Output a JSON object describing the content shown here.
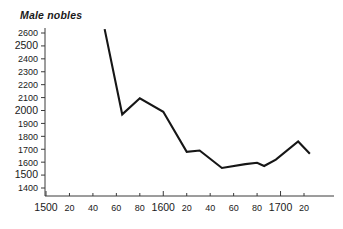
{
  "chart_data": {
    "type": "line",
    "title": "Male nobles",
    "xlabel": "",
    "ylabel": "",
    "grid": false,
    "legend": false,
    "xlim": [
      1500,
      1730
    ],
    "ylim": [
      1400,
      2650
    ],
    "x_tick_labels": [
      "1500",
      "20",
      "40",
      "60",
      "80",
      "1600",
      "20",
      "40",
      "60",
      "80",
      "1700",
      "20"
    ],
    "x_tick_values": [
      1500,
      1520,
      1540,
      1560,
      1580,
      1600,
      1620,
      1640,
      1660,
      1680,
      1700,
      1720
    ],
    "y_tick_labels": [
      "1400",
      "1500",
      "1600",
      "1700",
      "1800",
      "1900",
      "2000",
      "2100",
      "2200",
      "2300",
      "2400",
      "2500",
      "2600"
    ],
    "y_tick_values": [
      1400,
      1500,
      1600,
      1700,
      1800,
      1900,
      2000,
      2100,
      2200,
      2300,
      2400,
      2500,
      2600
    ],
    "series": [
      {
        "name": "Male nobles",
        "color": "#161616",
        "x": [
          1550,
          1565,
          1580,
          1600,
          1620,
          1631,
          1650,
          1670,
          1680,
          1686,
          1696,
          1715,
          1725
        ],
        "values": [
          2630,
          1970,
          2095,
          1990,
          1680,
          1690,
          1555,
          1585,
          1595,
          1570,
          1620,
          1760,
          1665
        ]
      }
    ]
  },
  "chart": {
    "title": "Male nobles"
  }
}
